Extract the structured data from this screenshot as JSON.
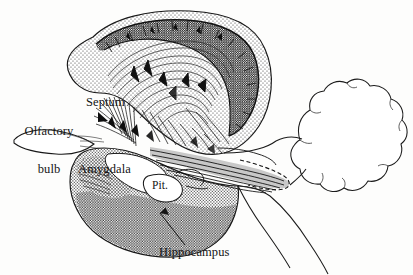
{
  "figure": {
    "kind": "anatomical-line-drawing",
    "background_color": "#fdfdfc",
    "ink_color": "#141414",
    "labels": {
      "olfactory_bulb": "Olfactory\nbulb",
      "olfactory_bulb_line1": "Olfactory",
      "olfactory_bulb_line2": "bulb",
      "septum": "Septum",
      "amygdala": "Amygdala",
      "pituitary": "Pit.",
      "hippocampus": "Hippocampus"
    },
    "structures": [
      {
        "name": "cerebral-hemisphere-outline",
        "shading": "stipple"
      },
      {
        "name": "cingulate-cortex-band",
        "shading": "dense-stipple-with-dark-fibers"
      },
      {
        "name": "corpus-callosum-fiber-fan",
        "shading": "fine-line-fibers"
      },
      {
        "name": "septum-fiber-bundle",
        "shading": "radiating-dark-fibers"
      },
      {
        "name": "olfactory-bulb",
        "shading": "outline-oval"
      },
      {
        "name": "amygdala",
        "shading": "cross-hatch"
      },
      {
        "name": "hippocampus",
        "shading": "dense-cross-stipple"
      },
      {
        "name": "pituitary",
        "shading": "outline-oval"
      },
      {
        "name": "brainstem-tract",
        "shading": "dark-tapering-bundle"
      },
      {
        "name": "cerebellum",
        "shading": "scalloped-outline-only"
      }
    ],
    "leader_lines": [
      {
        "from": "hippocampus-label",
        "to": "hippocampus-region",
        "arrowhead": true
      }
    ]
  }
}
